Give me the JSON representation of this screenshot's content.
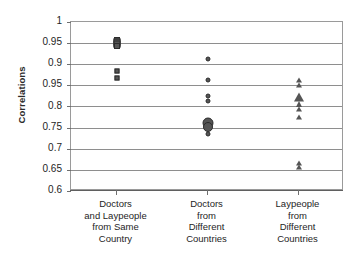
{
  "chart_data": {
    "type": "scatter",
    "title": "",
    "xlabel": "",
    "ylabel": "Correlations",
    "ylim": [
      0.6,
      1.0
    ],
    "grid": true,
    "legend": "none",
    "ytick_labels": [
      "1",
      "0.95",
      "0.9",
      "0.95",
      "0.8",
      "0.75",
      "0.7",
      "0.65",
      "0.6"
    ],
    "ytick_values": [
      1.0,
      0.95,
      0.9,
      0.85,
      0.8,
      0.75,
      0.7,
      0.65,
      0.6
    ],
    "ytick_note": "The fourth tick is printed as 0.95 in the original figure; by position it is the 0.85 gridline.",
    "categories": [
      "Doctors and Laypeople from Same Country",
      "Doctors from Different Countries",
      "Laypeople from Different Countries"
    ],
    "category_lines": [
      [
        "Doctors",
        "and Laypeople",
        "from Same",
        "Country"
      ],
      [
        "Doctors",
        "from",
        "Different",
        "Countries"
      ],
      [
        "Laypeople",
        "from",
        "Different",
        "Countries"
      ]
    ],
    "series": [
      {
        "name": "Doctors and Laypeople from Same Country",
        "marker": "square",
        "category_index": 0,
        "points": [
          {
            "value": 0.957,
            "size": 6
          },
          {
            "value": 0.952,
            "size": 7
          },
          {
            "value": 0.948,
            "size": 7
          },
          {
            "value": 0.944,
            "size": 6
          },
          {
            "value": 0.885,
            "size": 5
          },
          {
            "value": 0.868,
            "size": 5
          }
        ]
      },
      {
        "name": "Doctors from Different Countries",
        "marker": "circle",
        "category_index": 1,
        "points": [
          {
            "value": 0.912,
            "size": 5
          },
          {
            "value": 0.862,
            "size": 5
          },
          {
            "value": 0.825,
            "size": 5
          },
          {
            "value": 0.812,
            "size": 5
          },
          {
            "value": 0.762,
            "size": 11
          },
          {
            "value": 0.752,
            "size": 10
          },
          {
            "value": 0.735,
            "size": 5
          }
        ]
      },
      {
        "name": "Laypeople from Different Countries",
        "marker": "triangle",
        "category_index": 2,
        "points": [
          {
            "value": 0.862,
            "size": 5
          },
          {
            "value": 0.85,
            "size": 5
          },
          {
            "value": 0.822,
            "size": 9
          },
          {
            "value": 0.805,
            "size": 6
          },
          {
            "value": 0.795,
            "size": 5
          },
          {
            "value": 0.775,
            "size": 5
          },
          {
            "value": 0.667,
            "size": 5
          },
          {
            "value": 0.657,
            "size": 5
          }
        ]
      }
    ],
    "colors": {
      "marker_fill": "#555555",
      "marker_edge": "#2b2b2b",
      "gridline": "#8e8e8e",
      "frame": "#9a9a9a",
      "text": "#1e1e1e",
      "background": "#ffffff"
    }
  }
}
